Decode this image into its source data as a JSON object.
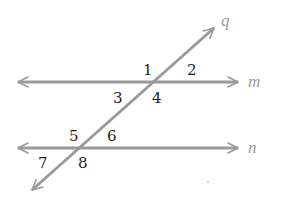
{
  "diagram": {
    "type": "parallel-lines-transversal",
    "colors": {
      "line": "#9a9a9a",
      "number": "#1e1e1e",
      "label": "#9a9a9a",
      "background": "#ffffff"
    },
    "lines": {
      "m": {
        "label": "m",
        "x1": 18,
        "x2": 238,
        "y": 82
      },
      "n": {
        "label": "n",
        "x1": 18,
        "x2": 238,
        "y": 148
      },
      "q": {
        "label": "q",
        "x1": 32,
        "y1": 190,
        "x2": 214,
        "y2": 28
      }
    },
    "angles": [
      {
        "label": "1",
        "x": 143,
        "y": 75
      },
      {
        "label": "2",
        "x": 187,
        "y": 75
      },
      {
        "label": "3",
        "x": 113,
        "y": 102
      },
      {
        "label": "4",
        "x": 152,
        "y": 102
      },
      {
        "label": "5",
        "x": 68,
        "y": 141
      },
      {
        "label": "6",
        "x": 106,
        "y": 141
      },
      {
        "label": "7",
        "x": 38,
        "y": 167
      },
      {
        "label": "8",
        "x": 77,
        "y": 167
      }
    ]
  }
}
